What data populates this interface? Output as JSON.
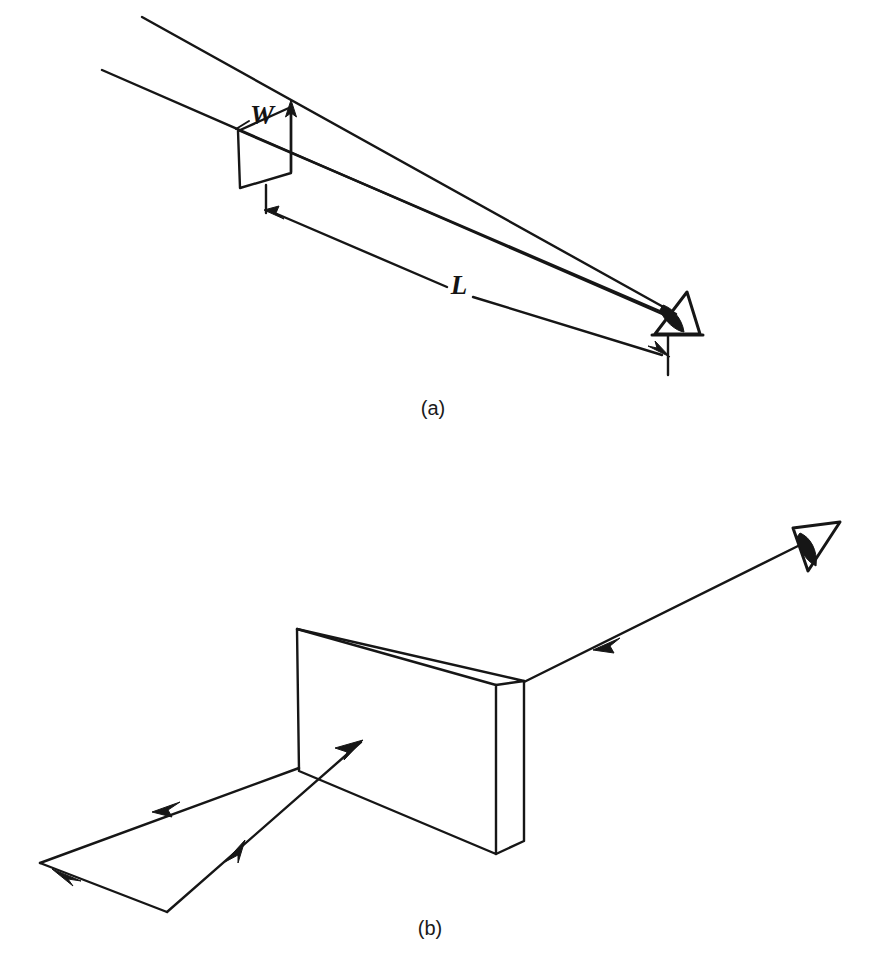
{
  "figure": {
    "background_color": "#ffffff",
    "line_color": "#161616",
    "panels": [
      {
        "id": "a",
        "caption": "(a)",
        "caption_position": {
          "x": 433,
          "y": 415
        },
        "description": "Two parallel sight lines diverging from an eye toward a distant object of width W at distance L",
        "labels": [
          {
            "name": "width-label",
            "text": "W",
            "x": 262,
            "y": 122,
            "style": "italic"
          },
          {
            "name": "distance-label",
            "text": "L",
            "x": 459,
            "y": 283,
            "style": "italic"
          }
        ],
        "eye": {
          "x": 676,
          "y": 318,
          "facing": "left"
        },
        "object": {
          "name": "target-patch",
          "center_x": 265,
          "center_y": 150
        }
      },
      {
        "id": "b",
        "caption": "(b)",
        "caption_position": {
          "x": 430,
          "y": 935
        },
        "description": "A rectangular slab viewed obliquely, with an incident ray path folding at the lower left and a ray traveling to the eye at the upper right",
        "labels": [],
        "eye": {
          "x": 813,
          "y": 542,
          "facing": "left"
        },
        "object": {
          "name": "rectangular-slab",
          "center_x": 400,
          "center_y": 740
        }
      }
    ],
    "symbols": {
      "width": "W",
      "length": "L"
    },
    "caption_a": "(a)",
    "caption_b": "(b)"
  }
}
